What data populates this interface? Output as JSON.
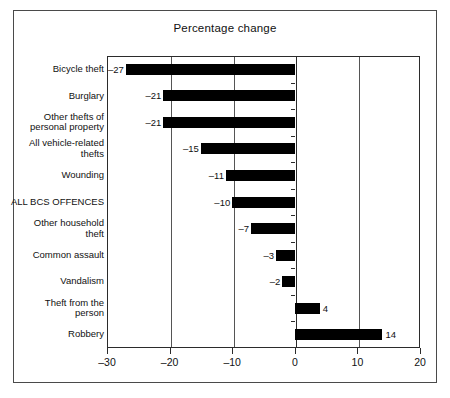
{
  "chart_data": {
    "type": "bar",
    "orientation": "horizontal",
    "title": "Percentage change",
    "xlabel": "",
    "ylabel": "",
    "xlim": [
      -30,
      20
    ],
    "xticks": [
      -30,
      -20,
      -10,
      0,
      10,
      20
    ],
    "xtick_labels": [
      "–30",
      "–20",
      "–10",
      "0",
      "10",
      "20"
    ],
    "grid": true,
    "legend": null,
    "categories": [
      "Bicycle theft",
      "Burglary",
      "Other thefts of\npersonal property",
      "All vehicle-related\nthefts",
      "Wounding",
      "ALL BCS OFFENCES",
      "Other household\ntheft",
      "Common assault",
      "Vandalism",
      "Theft from the\nperson",
      "Robbery"
    ],
    "values": [
      -27,
      -21,
      -21,
      -15,
      -11,
      -10,
      -7,
      -3,
      -2,
      4,
      14
    ],
    "value_labels": [
      "–27",
      "–21",
      "–21",
      "–15",
      "–11",
      "–10",
      "–7",
      "–3",
      "–2",
      "4",
      "14"
    ],
    "bar_color": "#000000"
  },
  "figure": {
    "title": "Percentage change",
    "frame_color": "#4a4a4a",
    "axis_color": "#2b2b2b",
    "background": "#ffffff"
  }
}
